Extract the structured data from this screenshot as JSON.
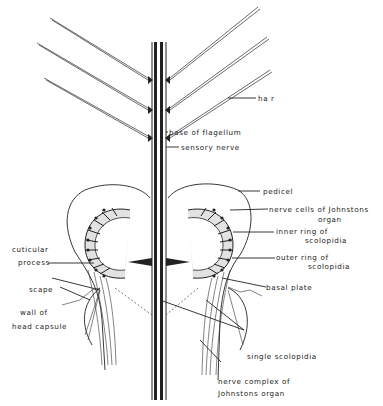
{
  "figure": {
    "colors": {
      "ink": "#222222",
      "background": "#ffffff",
      "shade": "#d8d8d8"
    }
  },
  "labels": {
    "hair": "ha r",
    "base_of_flagellum": "base of flagellum",
    "sensory_nerve": "sensory nerve",
    "pedicel": "pedicel",
    "nerve_cells_line1": "nerve cells of Johnstons",
    "nerve_cells_line2": "organ",
    "inner_ring_line1": "inner ring of",
    "inner_ring_line2": "scolopidia",
    "outer_ring_line1": "outer ring of",
    "outer_ring_line2": "scolopidia",
    "cuticular_process_line1": "cuticular",
    "cuticular_process_line2": "process",
    "basal_plate": "basal plate",
    "scape": "scape",
    "wall_line1": "wall of",
    "wall_line2": "head capsule",
    "single_scolopidia": "single scolopidia",
    "nerve_complex_line1": "nerve complex of",
    "nerve_complex_line2": "Johnstons organ"
  }
}
